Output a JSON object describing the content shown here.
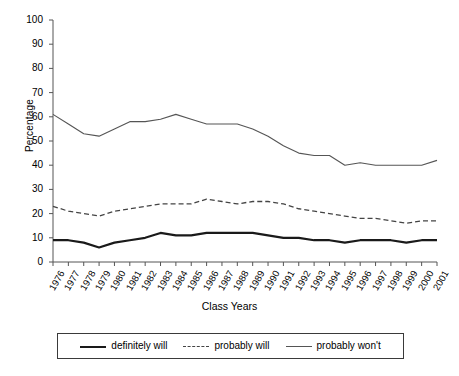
{
  "chart_data": {
    "type": "line",
    "title": "",
    "xlabel": "Class Years",
    "ylabel": "Percentage",
    "ylim": [
      0,
      100
    ],
    "yticks": [
      0,
      10,
      20,
      30,
      40,
      50,
      60,
      70,
      80,
      90,
      100
    ],
    "grid": false,
    "legend_position": "bottom",
    "categories": [
      "1976",
      "1977",
      "1978",
      "1979",
      "1980",
      "1981",
      "1982",
      "1983",
      "1984",
      "1985",
      "1986",
      "1987",
      "1988",
      "1989",
      "1990",
      "1991",
      "1992",
      "1993",
      "1994",
      "1995",
      "1996",
      "1997",
      "1998",
      "1999",
      "2000",
      "2001"
    ],
    "series": [
      {
        "name": "definitely will",
        "style": "solid-thick",
        "color": "#1a1a1a",
        "values": [
          9,
          9,
          8,
          6,
          8,
          9,
          10,
          12,
          11,
          11,
          12,
          12,
          12,
          12,
          11,
          10,
          10,
          9,
          9,
          8,
          9,
          9,
          9,
          8,
          9,
          9
        ]
      },
      {
        "name": "probably will",
        "style": "dashed",
        "color": "#444444",
        "values": [
          23,
          21,
          20,
          19,
          21,
          22,
          23,
          24,
          24,
          24,
          26,
          25,
          24,
          25,
          25,
          24,
          22,
          21,
          20,
          19,
          18,
          18,
          17,
          16,
          17,
          17
        ]
      },
      {
        "name": "probably won't",
        "style": "solid-thin",
        "color": "#555555",
        "values": [
          61,
          57,
          53,
          52,
          55,
          58,
          58,
          59,
          61,
          59,
          57,
          57,
          57,
          55,
          52,
          48,
          45,
          44,
          44,
          40,
          41,
          40,
          40,
          40,
          40,
          42
        ]
      }
    ]
  },
  "legend": {
    "items": [
      {
        "label": "definitely will"
      },
      {
        "label": "probably will"
      },
      {
        "label": "probably won't"
      }
    ]
  }
}
